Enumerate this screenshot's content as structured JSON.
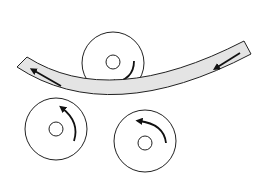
{
  "diagram": {
    "title": "Three-roll plate bending",
    "colors": {
      "background": "#ffffff",
      "stroke": "#222222",
      "plate_fill": "#e4e4e4",
      "arrow": "#111111"
    },
    "plate": {
      "label": "bent plate",
      "feed_direction": "right-to-left",
      "arrows": [
        {
          "name": "plate-arrow-left",
          "direction": "left"
        },
        {
          "name": "plate-arrow-right",
          "direction": "left"
        }
      ]
    },
    "rolls": [
      {
        "name": "top-roll",
        "cx": 113,
        "cy": 63,
        "r": 31,
        "hub_r": 7,
        "rotation": "counterclockwise"
      },
      {
        "name": "bottom-left-roll",
        "cx": 56,
        "cy": 129,
        "r": 31,
        "hub_r": 7,
        "rotation": "clockwise"
      },
      {
        "name": "bottom-right-roll",
        "cx": 145,
        "cy": 141,
        "r": 31,
        "hub_r": 7,
        "rotation": "counterclockwise"
      }
    ]
  }
}
